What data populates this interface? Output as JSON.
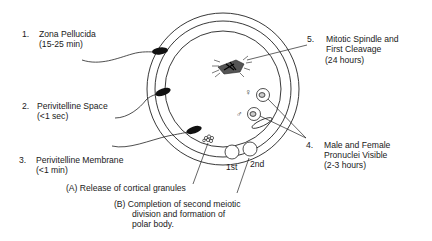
{
  "diagram": {
    "type": "fertilization-timeline",
    "egg": {
      "center": [
        223,
        88
      ],
      "rings": [
        "outer zona",
        "inner zona",
        "perivitelline membrane"
      ]
    },
    "labels": [
      {
        "num": "1.",
        "title": "Zona Pellucida",
        "time": "(15-25 min)"
      },
      {
        "num": "2.",
        "title": "Perivitelline Space",
        "time": "(<1 sec)"
      },
      {
        "num": "3.",
        "title": "Perivitelline Membrane",
        "time": "(<1 min)"
      },
      {
        "num": "4.",
        "title_line1": "Male and Female",
        "title_line2": "Pronuclei Visible",
        "time": "(2-3 hours)"
      },
      {
        "num": "5.",
        "title_line1": "Mitotic Spindle and",
        "title_line2": "First Cleavage",
        "time": "(24 hours)"
      }
    ],
    "events": {
      "a": "(A)  Release of cortical granules",
      "b_line1": "(B)  Completion of second meiotic",
      "b_line2": "division and formation of",
      "b_line3": "polar body."
    },
    "polar_bodies": {
      "first": "1st",
      "second": "2nd"
    },
    "symbols": {
      "female": "♀",
      "male": "♂"
    }
  }
}
